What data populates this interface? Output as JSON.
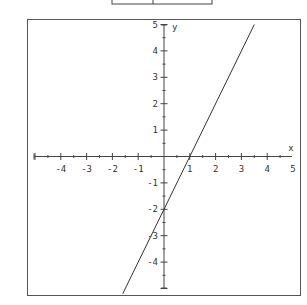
{
  "header_fragment": {
    "cells": 2
  },
  "chart_data": {
    "type": "line",
    "title": "",
    "xlabel": "x",
    "ylabel": "y",
    "xlim": [
      -5.3,
      5.3
    ],
    "ylim": [
      -5.2,
      5.2
    ],
    "grid": false,
    "legend": null,
    "x_ticks": [
      -4,
      -3,
      -2,
      -1,
      1,
      2,
      3,
      4,
      5
    ],
    "y_ticks": [
      5,
      4,
      3,
      2,
      1,
      -1,
      -2,
      -3,
      -4
    ],
    "minor_ticks_per_unit": 2,
    "series": [
      {
        "name": "y = 2x - 2",
        "equation": "y = 2x - 2",
        "slope": 2,
        "intercept": -2,
        "x": [
          -1.6,
          0,
          1,
          3.5
        ],
        "values": [
          -5.2,
          -2,
          0,
          5
        ]
      }
    ],
    "annotations": []
  }
}
